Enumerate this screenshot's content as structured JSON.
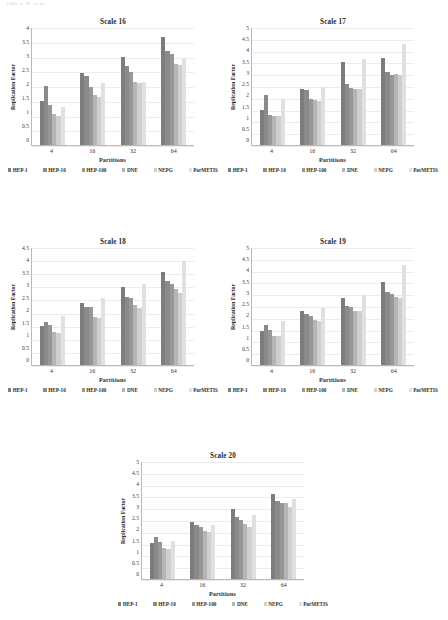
{
  "running_head": "1000        A. B. et al.",
  "series": [
    {
      "name": "HEP-1",
      "color": "#7d7d7d"
    },
    {
      "name": "HEP-10",
      "color": "#8a8a8a"
    },
    {
      "name": "HEP-100",
      "color": "#979797"
    },
    {
      "name": "DNE",
      "color": "#b5b5b5"
    },
    {
      "name": "NEPG",
      "color": "#cfcfcf"
    },
    {
      "name": "ParMETIS",
      "color": "#e0e0e0"
    }
  ],
  "common": {
    "xlabel": "Partitions",
    "ylabel": "Replication Factor",
    "categories": [
      "4",
      "16",
      "32",
      "64"
    ]
  },
  "chart_data": [
    {
      "type": "bar",
      "title": "Scale 16",
      "xlabel": "Partitions",
      "ylabel": "Replication Factor",
      "categories": [
        "4",
        "16",
        "32",
        "64"
      ],
      "ylim": [
        0,
        4
      ],
      "yticks": [
        "0",
        "0.5",
        "1",
        "1.5",
        "2",
        "2.5",
        "3",
        "3.5",
        "4"
      ],
      "grid": true,
      "legend": "bottom",
      "series": [
        {
          "name": "HEP-1",
          "values": [
            1.5,
            2.43,
            3.0,
            3.65
          ]
        },
        {
          "name": "HEP-10",
          "values": [
            2.0,
            2.33,
            2.67,
            3.18
          ]
        },
        {
          "name": "HEP-100",
          "values": [
            1.35,
            1.97,
            2.46,
            3.1
          ]
        },
        {
          "name": "DNE",
          "values": [
            1.05,
            1.7,
            2.13,
            2.73
          ]
        },
        {
          "name": "NEPG",
          "values": [
            1.0,
            1.64,
            2.1,
            2.71
          ]
        },
        {
          "name": "ParMETIS",
          "values": [
            1.3,
            2.1,
            2.12,
            2.9
          ]
        }
      ]
    },
    {
      "type": "bar",
      "title": "Scale 17",
      "xlabel": "Partitions",
      "ylabel": "Replication Factor",
      "categories": [
        "4",
        "16",
        "32",
        "64"
      ],
      "ylim": [
        0,
        5
      ],
      "yticks": [
        "0",
        "0.5",
        "1",
        "1.5",
        "2",
        "2.5",
        "3",
        "3.5",
        "4",
        "4.5",
        "5"
      ],
      "grid": true,
      "legend": "bottom",
      "series": [
        {
          "name": "HEP-1",
          "values": [
            1.5,
            2.38,
            3.5,
            3.67
          ]
        },
        {
          "name": "HEP-10",
          "values": [
            2.1,
            2.32,
            2.6,
            3.08
          ]
        },
        {
          "name": "HEP-100",
          "values": [
            1.28,
            1.95,
            2.4,
            2.98
          ]
        },
        {
          "name": "DNE",
          "values": [
            1.25,
            1.9,
            2.38,
            3.0
          ]
        },
        {
          "name": "NEPG",
          "values": [
            1.23,
            1.88,
            2.37,
            2.98
          ]
        },
        {
          "name": "ParMETIS",
          "values": [
            1.95,
            2.45,
            3.65,
            4.3
          ]
        }
      ]
    },
    {
      "type": "bar",
      "title": "Scale 18",
      "xlabel": "Partitions",
      "ylabel": "Replication Factor",
      "categories": [
        "4",
        "16",
        "32",
        "64"
      ],
      "ylim": [
        0,
        4.5
      ],
      "yticks": [
        "0",
        "0.5",
        "1",
        "1.5",
        "2",
        "2.5",
        "3",
        "3.5",
        "4",
        "4.5"
      ],
      "grid": true,
      "legend": "bottom",
      "series": [
        {
          "name": "HEP-1",
          "values": [
            1.5,
            2.38,
            2.97,
            3.55
          ]
        },
        {
          "name": "HEP-10",
          "values": [
            1.63,
            2.22,
            2.58,
            3.2
          ]
        },
        {
          "name": "HEP-100",
          "values": [
            1.52,
            2.2,
            2.55,
            3.08
          ]
        },
        {
          "name": "DNE",
          "values": [
            1.25,
            1.82,
            2.3,
            2.9
          ]
        },
        {
          "name": "NEPG",
          "values": [
            1.22,
            1.8,
            2.18,
            2.75
          ]
        },
        {
          "name": "ParMETIS",
          "values": [
            1.88,
            2.55,
            3.1,
            3.95
          ]
        }
      ]
    },
    {
      "type": "bar",
      "title": "Scale 19",
      "xlabel": "Partitions",
      "ylabel": "Replication Factor",
      "categories": [
        "4",
        "16",
        "32",
        "64"
      ],
      "ylim": [
        0,
        5
      ],
      "yticks": [
        "0",
        "0.5",
        "1",
        "1.5",
        "2",
        "2.5",
        "3",
        "3.5",
        "4",
        "4.5",
        "5"
      ],
      "grid": true,
      "legend": "bottom",
      "series": [
        {
          "name": "HEP-1",
          "values": [
            1.45,
            2.3,
            2.85,
            3.5
          ]
        },
        {
          "name": "HEP-10",
          "values": [
            1.7,
            2.18,
            2.5,
            3.08
          ]
        },
        {
          "name": "HEP-100",
          "values": [
            1.47,
            2.08,
            2.45,
            3.03
          ]
        },
        {
          "name": "DNE",
          "values": [
            1.25,
            1.92,
            2.3,
            2.88
          ]
        },
        {
          "name": "NEPG",
          "values": [
            1.22,
            1.85,
            2.28,
            2.82
          ]
        },
        {
          "name": "ParMETIS",
          "values": [
            1.85,
            2.4,
            2.95,
            4.25
          ]
        }
      ]
    },
    {
      "type": "bar",
      "title": "Scale 20",
      "xlabel": "Partitions",
      "ylabel": "Replication Factor",
      "categories": [
        "4",
        "16",
        "32",
        "64"
      ],
      "ylim": [
        0,
        5
      ],
      "yticks": [
        "0",
        "0.5",
        "1",
        "1.5",
        "2",
        "2.5",
        "3",
        "3.5",
        "4",
        "4.5",
        "5"
      ],
      "grid": true,
      "legend": "bottom",
      "series": [
        {
          "name": "HEP-1",
          "values": [
            1.52,
            2.4,
            2.98,
            3.6
          ]
        },
        {
          "name": "HEP-10",
          "values": [
            1.8,
            2.3,
            2.62,
            3.3
          ]
        },
        {
          "name": "HEP-100",
          "values": [
            1.55,
            2.2,
            2.52,
            3.2
          ]
        },
        {
          "name": "DNE",
          "values": [
            1.32,
            2.05,
            2.35,
            3.2
          ]
        },
        {
          "name": "NEPG",
          "values": [
            1.28,
            1.98,
            2.22,
            3.05
          ]
        },
        {
          "name": "ParMETIS",
          "values": [
            1.6,
            2.3,
            2.7,
            3.4
          ]
        }
      ]
    }
  ]
}
